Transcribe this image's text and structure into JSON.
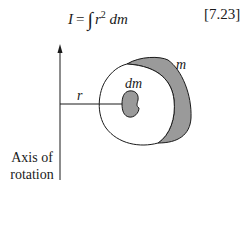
{
  "equation": {
    "lhs": "I",
    "equals": "=",
    "integral_sign": "∫",
    "integrand_var": "r",
    "exponent": "2",
    "differential": "dm",
    "number": "[7.23]"
  },
  "diagram": {
    "labels": {
      "radius": "r",
      "mass_element": "dm",
      "total_mass": "m"
    },
    "axis_caption_line1": "Axis of",
    "axis_caption_line2": "rotation",
    "colors": {
      "stroke": "#1a1a1a",
      "shaded_fill": "#9a9a9a",
      "body_fill": "#ffffff"
    }
  }
}
